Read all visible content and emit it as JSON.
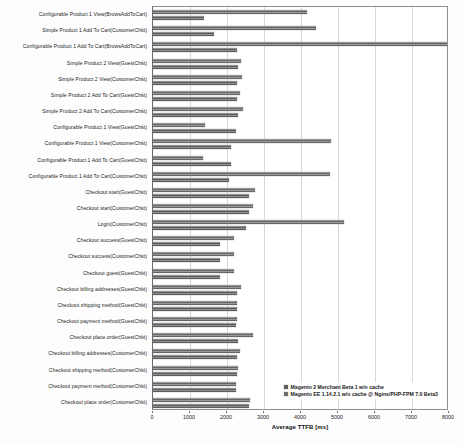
{
  "chart_data": {
    "type": "bar",
    "orientation": "horizontal",
    "title": "",
    "xlabel": "Average TTFB [ms]",
    "ylabel": "",
    "xlim": [
      0,
      8000
    ],
    "xticks": [
      0,
      1000,
      2000,
      3000,
      4000,
      5000,
      6000,
      7000,
      8000
    ],
    "grid": true,
    "legend_position": "bottom-right-inside",
    "categories": [
      "Configurable Product 1 View(BrowsAddToCart)",
      "Simple Product 1 Add To Cart(CustomerChkt)",
      "Configurable Product 1 Add To Cart(BrowsAddToCart)",
      "Simple Product 2 View(GuestChkt)",
      "Simple Product 2 View(CustomerChkt)",
      "Simple Product 2 Add To Cart(GuestChkt)",
      "Simple Product 2 Add To Cart(CustomerChkt)",
      "Configurable Product 1 View(GuestChkt)",
      "Configurable Product 1 View(CustomerChkt)",
      "Configurable Product 1 Add To Cart(GuestChkt)",
      "Configurable Product 1 Add To Cart(CustomerChkt)",
      "Checkout start(GuestChkt)",
      "Checkout start(CustomerChkt)",
      "Login(CustomerChkt)",
      "Checkout success(GuestChkt)",
      "Checkout success(CustomerChkt)",
      "Checkout guest(GuestChkt)",
      "Checkout billing addresses(GuestChkt)",
      "Checkout shipping method(GuestChkt)",
      "Checkout payment method(GuestChkt)",
      "Checkout place order(GuestChkt)",
      "Checkout billing addresses(CustomerChkt)",
      "Checkout shipping method(CustomerChkt)",
      "Checkout payment method(CustomerChkt)",
      "Checkout place order(CustomerChkt)"
    ],
    "series": [
      {
        "name": "Magento 2 Merchant Beta 1 w/o cache",
        "color": "#6e6e6e",
        "values": [
          4170,
          4400,
          8000,
          2380,
          2400,
          2350,
          2430,
          1400,
          4800,
          1340,
          4780,
          2750,
          2700,
          5150,
          2180,
          2200,
          2180,
          2380,
          2280,
          2260,
          2700,
          2350,
          2300,
          2230,
          2620
        ]
      },
      {
        "name": "Magento EE 1.14.2.1 w/o cache @ Nginx/PHP-FPM 7.0 Beta3",
        "color": "#636363",
        "values": [
          1380,
          1650,
          2280,
          2300,
          2280,
          2260,
          2300,
          2250,
          2120,
          2120,
          2060,
          2600,
          2600,
          2500,
          1800,
          1820,
          1800,
          2260,
          2280,
          2250,
          2300,
          2280,
          2260,
          2230,
          2600
        ]
      }
    ]
  },
  "legend": {
    "items": [
      {
        "label": "Magento 2 Merchant Beta 1 w/o cache"
      },
      {
        "label": "Magento EE 1.14.2.1 w/o cache @ Nginx/PHP-FPM 7.0 Beta3"
      }
    ]
  }
}
